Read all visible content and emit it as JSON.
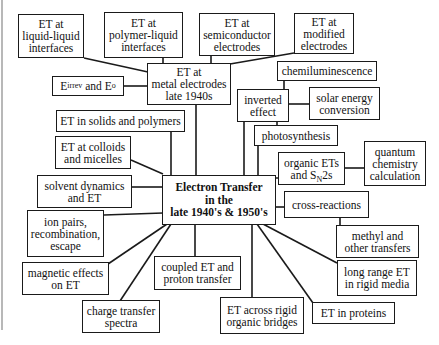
{
  "diagram": {
    "title": "Electron Transfer in the late 1940's & 1950's",
    "center": {
      "id": "center",
      "label": "Electron Transfer\nin the\nlate 1940's & 1950's",
      "x": 162,
      "y": 175,
      "w": 114,
      "h": 50
    },
    "nodes": [
      {
        "id": "liquid-liquid",
        "label": "ET at\nliquid-liquid\ninterfaces",
        "x": 18,
        "y": 14,
        "w": 66,
        "h": 44
      },
      {
        "id": "polymer-liquid",
        "label": "ET at\npolymer-liquid\ninterfaces",
        "x": 104,
        "y": 12,
        "w": 79,
        "h": 46
      },
      {
        "id": "semiconductor",
        "label": "ET at\nsemiconductor\nelectrodes",
        "x": 199,
        "y": 13,
        "w": 76,
        "h": 43
      },
      {
        "id": "modified",
        "label": "ET at\nmodified\nelectrodes",
        "x": 294,
        "y": 13,
        "w": 60,
        "h": 41
      },
      {
        "id": "metal",
        "label": "ET at\nmetal electrodes\nlate 1940s",
        "x": 147,
        "y": 63,
        "w": 84,
        "h": 42
      },
      {
        "id": "eirrev",
        "label": "E",
        "sup1": "irrev",
        "mid": " and E",
        "sup2": "o",
        "x": 52,
        "y": 76,
        "w": 72,
        "h": 20
      },
      {
        "id": "chemiluminescence",
        "label": "chemiluminescence",
        "x": 277,
        "y": 61,
        "w": 100,
        "h": 20
      },
      {
        "id": "inverted",
        "label": "inverted\neffect",
        "x": 237,
        "y": 89,
        "w": 52,
        "h": 33
      },
      {
        "id": "solar",
        "label": "solar energy\nconversion",
        "x": 309,
        "y": 87,
        "w": 71,
        "h": 33
      },
      {
        "id": "solids",
        "label": "ET in solids and polymers",
        "x": 56,
        "y": 110,
        "w": 129,
        "h": 22
      },
      {
        "id": "photosynthesis",
        "label": "photosynthesis",
        "x": 254,
        "y": 125,
        "w": 84,
        "h": 21
      },
      {
        "id": "colloids",
        "label": "ET at colloids\nand micelles",
        "x": 55,
        "y": 136,
        "w": 76,
        "h": 33
      },
      {
        "id": "organic",
        "label": "organic ETs\nand S_N2s",
        "x": 278,
        "y": 152,
        "w": 67,
        "h": 33
      },
      {
        "id": "quantum",
        "label": "quantum\nchemistry\ncalculation",
        "x": 364,
        "y": 141,
        "w": 62,
        "h": 45
      },
      {
        "id": "solvent",
        "label": "solvent dynamics\nand ET",
        "x": 37,
        "y": 175,
        "w": 95,
        "h": 33
      },
      {
        "id": "cross",
        "label": "cross-reactions",
        "x": 284,
        "y": 191,
        "w": 85,
        "h": 27
      },
      {
        "id": "ionpairs",
        "label": "ion pairs,\nrecombination,\nescape",
        "x": 27,
        "y": 210,
        "w": 77,
        "h": 47
      },
      {
        "id": "methyl",
        "label": "methyl and\nother transfers",
        "x": 336,
        "y": 225,
        "w": 83,
        "h": 33
      },
      {
        "id": "magnetic",
        "label": "magnetic effects\non ET",
        "x": 22,
        "y": 262,
        "w": 87,
        "h": 33
      },
      {
        "id": "coupled",
        "label": "coupled ET and\nproton transfer",
        "x": 154,
        "y": 256,
        "w": 87,
        "h": 34
      },
      {
        "id": "longrange",
        "label": "long range ET\nin rigid media",
        "x": 337,
        "y": 260,
        "w": 80,
        "h": 36
      },
      {
        "id": "chargetransfer",
        "label": "charge transfer\nspectra",
        "x": 82,
        "y": 300,
        "w": 78,
        "h": 33
      },
      {
        "id": "rigidbridges",
        "label": "ET across rigid\norganic bridges",
        "x": 220,
        "y": 297,
        "w": 84,
        "h": 37
      },
      {
        "id": "proteins",
        "label": "ET in proteins",
        "x": 312,
        "y": 302,
        "w": 83,
        "h": 22
      }
    ],
    "links": [
      {
        "from": "liquid-liquid",
        "to": "metal",
        "pts": [
          [
            84,
            58
          ],
          [
            148,
            72
          ]
        ]
      },
      {
        "from": "polymer-liquid",
        "to": "metal",
        "pts": [
          [
            163,
            58
          ],
          [
            163,
            64
          ]
        ]
      },
      {
        "from": "semiconductor",
        "to": "metal",
        "pts": [
          [
            211,
            56
          ],
          [
            211,
            64
          ]
        ]
      },
      {
        "from": "modified",
        "to": "metal",
        "pts": [
          [
            294,
            53
          ],
          [
            230,
            64
          ]
        ]
      },
      {
        "from": "eirrev",
        "to": "metal",
        "pts": [
          [
            124,
            86
          ],
          [
            148,
            86
          ]
        ]
      },
      {
        "from": "metal",
        "to": "center",
        "pts": [
          [
            196,
            105
          ],
          [
            196,
            176
          ]
        ]
      },
      {
        "from": "solids",
        "to": "center",
        "pts": [
          [
            171,
            132
          ],
          [
            171,
            176
          ]
        ]
      },
      {
        "from": "colloids",
        "to": "center",
        "pts": [
          [
            131,
            160
          ],
          [
            163,
            174
          ]
        ]
      },
      {
        "from": "solvent",
        "to": "center",
        "pts": [
          [
            132,
            187
          ],
          [
            163,
            187
          ]
        ]
      },
      {
        "from": "ionpairs",
        "to": "center",
        "pts": [
          [
            104,
            215
          ],
          [
            163,
            213
          ]
        ]
      },
      {
        "from": "magnetic",
        "to": "center",
        "pts": [
          [
            108,
            264
          ],
          [
            167,
            224
          ]
        ]
      },
      {
        "from": "chargetransfer",
        "to": "center",
        "pts": [
          [
            120,
            301
          ],
          [
            171,
            224
          ]
        ]
      },
      {
        "from": "coupled",
        "to": "center",
        "pts": [
          [
            195,
            256
          ],
          [
            195,
            224
          ]
        ]
      },
      {
        "from": "rigidbridges",
        "to": "center",
        "pts": [
          [
            252,
            297
          ],
          [
            252,
            224
          ]
        ]
      },
      {
        "from": "proteins",
        "to": "center",
        "pts": [
          [
            313,
            303
          ],
          [
            257,
            224
          ]
        ]
      },
      {
        "from": "longrange",
        "to": "center",
        "pts": [
          [
            337,
            263
          ],
          [
            263,
            224
          ]
        ]
      },
      {
        "from": "chemiluminescence",
        "to": "inverted",
        "pts": [
          [
            284,
            81
          ],
          [
            284,
            90
          ]
        ]
      },
      {
        "from": "inverted",
        "to": "solar",
        "pts": [
          [
            289,
            104
          ],
          [
            309,
            104
          ]
        ]
      },
      {
        "from": "inverted",
        "to": "photosynthesis",
        "pts": [
          [
            277,
            122
          ],
          [
            277,
            126
          ]
        ]
      },
      {
        "from": "inverted",
        "to": "center",
        "pts": [
          [
            244,
            122
          ],
          [
            244,
            176
          ]
        ]
      },
      {
        "from": "photosynthesis",
        "to": "center",
        "pts": [
          [
            258,
            146
          ],
          [
            258,
            176
          ]
        ]
      },
      {
        "from": "organic",
        "to": "center",
        "pts": [
          [
            276,
            178
          ],
          [
            278,
            178
          ]
        ]
      },
      {
        "from": "organic",
        "to": "quantum",
        "pts": [
          [
            345,
            168
          ],
          [
            364,
            168
          ]
        ]
      },
      {
        "from": "cross",
        "to": "center",
        "pts": [
          [
            276,
            207
          ],
          [
            284,
            207
          ]
        ]
      },
      {
        "from": "cross",
        "to": "methyl",
        "pts": [
          [
            340,
            218
          ],
          [
            340,
            226
          ]
        ]
      }
    ]
  }
}
